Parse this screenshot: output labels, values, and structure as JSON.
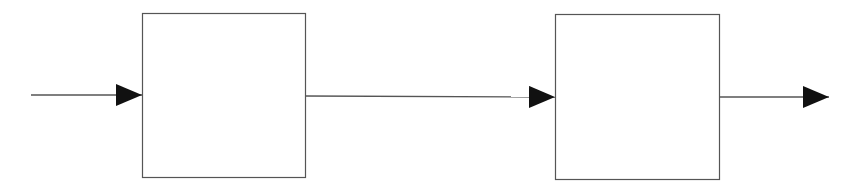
{
  "diagram": {
    "type": "block-diagram",
    "background": "#ffffff",
    "stroke_color": "#555555",
    "arrow_color": "#111111",
    "blocks": [
      {
        "id": "block-1",
        "label": "",
        "x": 142,
        "y": 13,
        "width": 163,
        "height": 164
      },
      {
        "id": "block-2",
        "label": "",
        "x": 555,
        "y": 14,
        "width": 164,
        "height": 165
      }
    ],
    "connections": [
      {
        "id": "input-arrow",
        "from": "input",
        "to": "block-1",
        "x1": 31,
        "y1": 95,
        "x2": 142,
        "y2": 95
      },
      {
        "id": "link-arrow",
        "from": "block-1",
        "to": "block-2",
        "x1": 305,
        "y1": 96,
        "x2": 555,
        "y2": 97
      },
      {
        "id": "output-arrow",
        "from": "block-2",
        "to": "output",
        "x1": 719,
        "y1": 97,
        "x2": 829,
        "y2": 97
      }
    ]
  }
}
